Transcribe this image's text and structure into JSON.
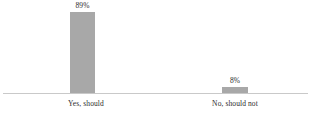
{
  "chart_data": {
    "type": "bar",
    "title": "",
    "subtitle": "",
    "xlabel": "",
    "ylabel": "",
    "categories": [
      "Yes, should",
      "No, should not"
    ],
    "values": [
      89,
      8
    ],
    "value_labels": [
      "89%",
      "8%"
    ],
    "ylim": [
      0,
      100
    ],
    "grid": false,
    "legend": false,
    "legend_position": "none",
    "orientation": "vertical",
    "series": [
      {
        "name": "",
        "values": [
          89,
          8
        ]
      }
    ],
    "colors": {
      "bar_fill": "#a8a8a8",
      "axis_line": "#c9c9c9",
      "text": "#2b2b2b",
      "background": "#ffffff"
    }
  }
}
